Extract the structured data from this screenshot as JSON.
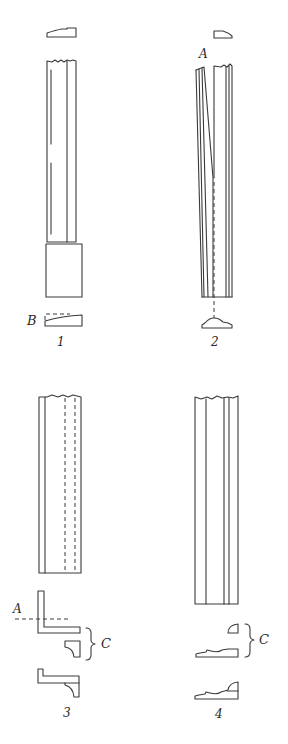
{
  "figure": {
    "panels": [
      {
        "id": "1",
        "label": "1",
        "callouts": [
          "B"
        ]
      },
      {
        "id": "2",
        "label": "2",
        "callouts": [
          "A"
        ]
      },
      {
        "id": "3",
        "label": "3",
        "callouts": [
          "A",
          "C"
        ]
      },
      {
        "id": "4",
        "label": "4",
        "callouts": [
          "C"
        ]
      }
    ]
  },
  "labels": {
    "panel1_number": "1",
    "panel2_number": "2",
    "panel3_number": "3",
    "panel4_number": "4",
    "callout_B": "B",
    "callout_A_panel2": "A",
    "callout_A_panel3": "A",
    "callout_C_panel3": "C",
    "callout_C_panel4": "C"
  },
  "colors": {
    "line": "#3a3a3a",
    "background": "#ffffff"
  }
}
